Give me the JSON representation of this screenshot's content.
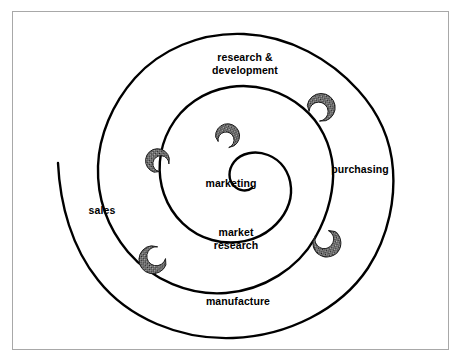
{
  "figure": {
    "frame_color": "#a8a8a8",
    "line_color": "#000000",
    "background_color": "#ffffff",
    "marker_fill": "#6b6b6b"
  },
  "diagram": {
    "type": "spiral",
    "direction": "inward-clockwise",
    "turns": 2.5,
    "stage_count": 6,
    "marker_count": 6,
    "stages": [
      {
        "id": "research-development",
        "label": "research &\ndevelopment",
        "x": 245,
        "y": 63,
        "order": 1
      },
      {
        "id": "purchasing",
        "label": "purchasing",
        "x": 360,
        "y": 169,
        "order": 2
      },
      {
        "id": "manufacture",
        "label": "manufacture",
        "x": 238,
        "y": 301,
        "order": 3
      },
      {
        "id": "sales",
        "label": "sales",
        "x": 102,
        "y": 210,
        "order": 4
      },
      {
        "id": "market-research",
        "label": "market\nresearch",
        "x": 236,
        "y": 238,
        "order": 5
      },
      {
        "id": "marketing",
        "label": "marketing",
        "x": 231,
        "y": 183,
        "order": 6
      }
    ],
    "markers": [
      {
        "id": "marker-outer-top-right",
        "x": 322,
        "y": 107,
        "rotation": 35
      },
      {
        "id": "marker-outer-bottom-right",
        "x": 327,
        "y": 244,
        "rotation": 150
      },
      {
        "id": "marker-outer-bottom-left",
        "x": 152,
        "y": 260,
        "rotation": 228
      },
      {
        "id": "marker-mid-left",
        "x": 157,
        "y": 160,
        "rotation": 312
      },
      {
        "id": "marker-inner-top",
        "x": 228,
        "y": 135,
        "rotation": 20
      }
    ]
  }
}
